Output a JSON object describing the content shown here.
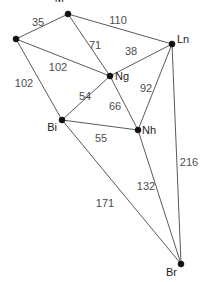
{
  "diagram": {
    "type": "weighted-undirected-graph",
    "width": 220,
    "height": 282,
    "background_color": "#ffffff",
    "node_color": "#111111",
    "edge_color": "#5a5a5a",
    "label_color": "#4d4d4d",
    "nodes": [
      {
        "id": "M",
        "label": "M",
        "x": 68,
        "y": 14,
        "label_dx": -4,
        "label_dy": -16
      },
      {
        "id": "Lp",
        "label": "Lp",
        "x": 16,
        "y": 39,
        "label_dx": -16,
        "label_dy": -5
      },
      {
        "id": "Ln",
        "label": "Ln",
        "x": 172,
        "y": 44,
        "label_dx": 5,
        "label_dy": -5
      },
      {
        "id": "Ng",
        "label": "Ng",
        "x": 110,
        "y": 76,
        "label_dx": 5,
        "label_dy": 0
      },
      {
        "id": "Bi",
        "label": "Bi",
        "x": 62,
        "y": 120,
        "label_dx": -5,
        "label_dy": 7
      },
      {
        "id": "Nh",
        "label": "Nh",
        "x": 138,
        "y": 130,
        "label_dx": 4,
        "label_dy": 0
      },
      {
        "id": "Br",
        "label": "Br",
        "x": 181,
        "y": 264,
        "label_dx": -4,
        "label_dy": 8
      }
    ],
    "edges": [
      {
        "from": "Lp",
        "to": "M",
        "weight": "35",
        "label_x": 38,
        "label_y": 22
      },
      {
        "from": "M",
        "to": "Ln",
        "weight": "110",
        "label_x": 118,
        "label_y": 20
      },
      {
        "from": "M",
        "to": "Ng",
        "weight": "71",
        "label_x": 95,
        "label_y": 45
      },
      {
        "from": "Ng",
        "to": "Ln",
        "weight": "38",
        "label_x": 131,
        "label_y": 51
      },
      {
        "from": "Lp",
        "to": "Ng",
        "weight": "102",
        "label_x": 58,
        "label_y": 67
      },
      {
        "from": "Lp",
        "to": "Bi",
        "weight": "102",
        "label_x": 24,
        "label_y": 83
      },
      {
        "from": "Bi",
        "to": "Ng",
        "weight": "54",
        "label_x": 85,
        "label_y": 96
      },
      {
        "from": "Ng",
        "to": "Nh",
        "weight": "66",
        "label_x": 115,
        "label_y": 106
      },
      {
        "from": "Ln",
        "to": "Nh",
        "weight": "92",
        "label_x": 146,
        "label_y": 88
      },
      {
        "from": "Bi",
        "to": "Nh",
        "weight": "55",
        "label_x": 101,
        "label_y": 138
      },
      {
        "from": "Ln",
        "to": "Br",
        "weight": "216",
        "label_x": 189,
        "label_y": 162
      },
      {
        "from": "Nh",
        "to": "Br",
        "weight": "132",
        "label_x": 146,
        "label_y": 186
      },
      {
        "from": "Bi",
        "to": "Br",
        "weight": "171",
        "label_x": 105,
        "label_y": 203
      }
    ]
  }
}
